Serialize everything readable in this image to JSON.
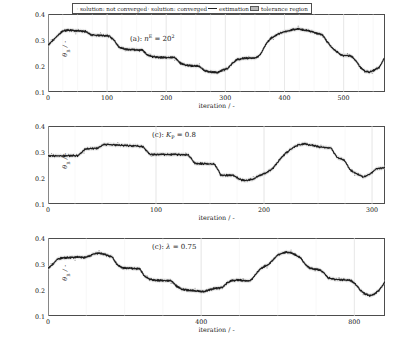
{
  "figure": {
    "name": "theta-b-vs-iteration-three-panels",
    "panel_count": 3
  },
  "legend": {
    "items": [
      {
        "label": "solution: not converged",
        "marker": "dot-marker-gray",
        "color": "#808080"
      },
      {
        "label": "solution: converged",
        "marker": "dot-marker-black",
        "color": "#222222"
      },
      {
        "label": "estimation",
        "marker": "solid-line",
        "color": "#222222"
      },
      {
        "label": "tolerance region",
        "marker": "shaded-band",
        "color": "#b9b9b9"
      }
    ]
  },
  "axis_common": {
    "ylabel": "θ",
    "ylabel_sub": "B",
    "ylabel_unit": "/ -",
    "xlabel": "iteration / -",
    "yticks": [
      "0.1",
      "0.2",
      "0.3",
      "0.4"
    ],
    "ylim": [
      0.1,
      0.4
    ]
  },
  "chart_data": [
    {
      "type": "line",
      "panel": "a",
      "title_prefix": "(a):",
      "title_symbol": "n",
      "title_sup": "E",
      "title_value": "= 20",
      "title_value_sup": "2",
      "title_full": "(a): n^E = 20^2",
      "xlabel": "iteration / -",
      "ylabel": "θ_B / -",
      "xlim": [
        0,
        570
      ],
      "ylim": [
        0.1,
        0.4
      ],
      "xticks": [
        0,
        100,
        200,
        300,
        400,
        500
      ],
      "yticks": [
        0.1,
        0.2,
        0.3,
        0.4
      ],
      "grid": true,
      "series": [
        {
          "name": "estimation",
          "x": [
            0,
            8,
            16,
            24,
            32,
            40,
            48,
            56,
            64,
            72,
            80,
            88,
            96,
            104,
            112,
            120,
            128,
            136,
            144,
            152,
            160,
            168,
            176,
            184,
            192,
            200,
            208,
            216,
            224,
            232,
            240,
            248,
            256,
            264,
            272,
            280,
            288,
            296,
            304,
            312,
            320,
            328,
            336,
            344,
            352,
            360,
            368,
            376,
            384,
            392,
            400,
            408,
            416,
            424,
            432,
            440,
            448,
            456,
            464,
            472,
            480,
            488,
            496,
            504,
            512,
            520,
            528,
            536,
            544,
            552,
            560,
            568
          ],
          "values": [
            0.283,
            0.3,
            0.318,
            0.335,
            0.34,
            0.339,
            0.337,
            0.336,
            0.335,
            0.322,
            0.32,
            0.319,
            0.318,
            0.317,
            0.3,
            0.274,
            0.268,
            0.265,
            0.264,
            0.263,
            0.262,
            0.244,
            0.238,
            0.236,
            0.235,
            0.234,
            0.234,
            0.233,
            0.212,
            0.205,
            0.203,
            0.202,
            0.201,
            0.185,
            0.18,
            0.178,
            0.177,
            0.186,
            0.192,
            0.213,
            0.227,
            0.23,
            0.232,
            0.233,
            0.234,
            0.247,
            0.284,
            0.307,
            0.318,
            0.327,
            0.333,
            0.338,
            0.342,
            0.344,
            0.341,
            0.337,
            0.333,
            0.327,
            0.322,
            0.296,
            0.272,
            0.258,
            0.243,
            0.242,
            0.241,
            0.224,
            0.198,
            0.181,
            0.178,
            0.186,
            0.196,
            0.228
          ]
        }
      ]
    },
    {
      "type": "line",
      "panel": "c1",
      "title_prefix": "(c):",
      "title_symbol": "K",
      "title_sub": "P",
      "title_value": "= 0.8",
      "title_full": "(c): K_P = 0.8",
      "xlabel": "iteration / -",
      "ylabel": "θ_B / -",
      "xlim": [
        0,
        312
      ],
      "ylim": [
        0.1,
        0.4
      ],
      "xticks": [
        0,
        100,
        200,
        300
      ],
      "yticks": [
        0.1,
        0.2,
        0.3,
        0.4
      ],
      "grid": true,
      "series": [
        {
          "name": "estimation",
          "x": [
            0,
            5,
            10,
            16,
            22,
            28,
            34,
            40,
            46,
            52,
            58,
            64,
            70,
            76,
            82,
            88,
            94,
            100,
            106,
            112,
            118,
            124,
            130,
            136,
            142,
            148,
            154,
            160,
            166,
            172,
            178,
            184,
            190,
            196,
            202,
            208,
            214,
            220,
            226,
            232,
            238,
            244,
            250,
            256,
            262,
            268,
            274,
            280,
            286,
            292,
            298,
            304,
            312
          ],
          "values": [
            0.288,
            0.287,
            0.287,
            0.287,
            0.288,
            0.288,
            0.312,
            0.315,
            0.317,
            0.331,
            0.33,
            0.328,
            0.327,
            0.326,
            0.325,
            0.322,
            0.293,
            0.292,
            0.292,
            0.292,
            0.292,
            0.291,
            0.29,
            0.258,
            0.257,
            0.256,
            0.255,
            0.214,
            0.212,
            0.211,
            0.195,
            0.192,
            0.198,
            0.212,
            0.222,
            0.238,
            0.27,
            0.296,
            0.316,
            0.33,
            0.333,
            0.328,
            0.322,
            0.32,
            0.318,
            0.278,
            0.272,
            0.232,
            0.218,
            0.205,
            0.216,
            0.238,
            0.24
          ]
        }
      ]
    },
    {
      "type": "line",
      "panel": "c2",
      "title_prefix": "(c):",
      "title_symbol": "λ",
      "title_value": "= 0.75",
      "title_full": "(c): λ = 0.75",
      "xlabel": "iteration / -",
      "ylabel": "θ_B / -",
      "xlim": [
        0,
        880
      ],
      "ylim": [
        0.1,
        0.4
      ],
      "xticks": [
        0,
        400,
        800
      ],
      "yticks": [
        0.1,
        0.2,
        0.3,
        0.4
      ],
      "grid": true,
      "series": [
        {
          "name": "estimation",
          "x": [
            0,
            12,
            24,
            36,
            48,
            60,
            72,
            84,
            96,
            108,
            120,
            132,
            144,
            156,
            168,
            180,
            192,
            204,
            216,
            228,
            240,
            252,
            264,
            276,
            288,
            300,
            312,
            324,
            336,
            348,
            360,
            372,
            384,
            396,
            408,
            420,
            432,
            444,
            456,
            468,
            480,
            492,
            504,
            516,
            528,
            540,
            552,
            564,
            576,
            588,
            600,
            612,
            624,
            636,
            648,
            660,
            672,
            684,
            696,
            708,
            720,
            732,
            744,
            756,
            768,
            780,
            792,
            804,
            816,
            828,
            840,
            852,
            864,
            880
          ],
          "values": [
            0.286,
            0.3,
            0.32,
            0.325,
            0.326,
            0.327,
            0.328,
            0.328,
            0.327,
            0.332,
            0.341,
            0.343,
            0.34,
            0.335,
            0.328,
            0.3,
            0.288,
            0.286,
            0.285,
            0.284,
            0.282,
            0.255,
            0.244,
            0.24,
            0.239,
            0.238,
            0.237,
            0.236,
            0.216,
            0.205,
            0.202,
            0.2,
            0.199,
            0.197,
            0.196,
            0.202,
            0.207,
            0.208,
            0.212,
            0.23,
            0.238,
            0.24,
            0.239,
            0.238,
            0.238,
            0.256,
            0.28,
            0.292,
            0.3,
            0.318,
            0.336,
            0.344,
            0.347,
            0.344,
            0.336,
            0.324,
            0.3,
            0.286,
            0.282,
            0.28,
            0.268,
            0.248,
            0.244,
            0.242,
            0.241,
            0.24,
            0.238,
            0.222,
            0.2,
            0.186,
            0.18,
            0.186,
            0.2,
            0.232
          ]
        }
      ]
    }
  ]
}
